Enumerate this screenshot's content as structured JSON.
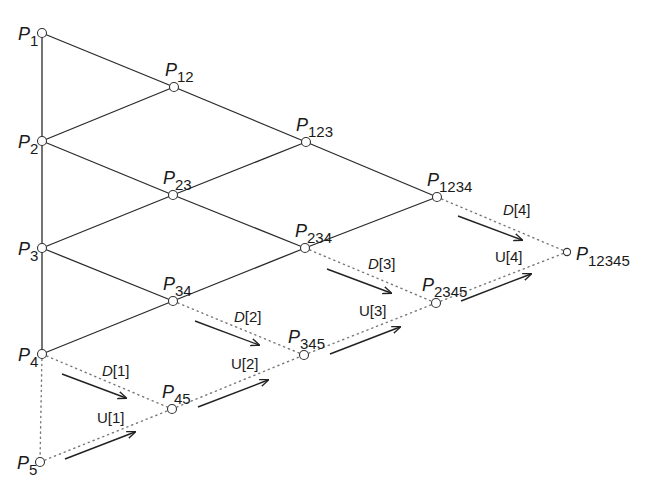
{
  "diagram": {
    "nodes": [
      {
        "id": "P1",
        "base": "P",
        "sub": "1",
        "x": 42,
        "y": 33,
        "lx": 18,
        "ly": 40
      },
      {
        "id": "P2",
        "base": "P",
        "sub": "2",
        "x": 42,
        "y": 141,
        "lx": 18,
        "ly": 148
      },
      {
        "id": "P3",
        "base": "P",
        "sub": "3",
        "x": 42,
        "y": 248,
        "lx": 18,
        "ly": 255
      },
      {
        "id": "P4",
        "base": "P",
        "sub": "4",
        "x": 42,
        "y": 354,
        "lx": 18,
        "ly": 361
      },
      {
        "id": "P5",
        "base": "P",
        "sub": "5",
        "x": 40,
        "y": 462,
        "lx": 17,
        "ly": 469
      },
      {
        "id": "P12",
        "base": "P",
        "sub": "12",
        "x": 174,
        "y": 87,
        "lx": 165,
        "ly": 76
      },
      {
        "id": "P23",
        "base": "P",
        "sub": "23",
        "x": 173,
        "y": 195,
        "lx": 163,
        "ly": 184
      },
      {
        "id": "P34",
        "base": "P",
        "sub": "34",
        "x": 173,
        "y": 301,
        "lx": 163,
        "ly": 290
      },
      {
        "id": "P45",
        "base": "P",
        "sub": "45",
        "x": 172,
        "y": 409,
        "lx": 162,
        "ly": 398
      },
      {
        "id": "P123",
        "base": "P",
        "sub": "123",
        "x": 306,
        "y": 142,
        "lx": 296,
        "ly": 131
      },
      {
        "id": "P234",
        "base": "P",
        "sub": "234",
        "x": 305,
        "y": 248,
        "lx": 295,
        "ly": 237
      },
      {
        "id": "P345",
        "base": "P",
        "sub": "345",
        "x": 304,
        "y": 355,
        "lx": 288,
        "ly": 343
      },
      {
        "id": "P1234",
        "base": "P",
        "sub": "1234",
        "x": 437,
        "y": 197,
        "lx": 427,
        "ly": 186
      },
      {
        "id": "P2345",
        "base": "P",
        "sub": "2345",
        "x": 436,
        "y": 303,
        "lx": 422,
        "ly": 291
      },
      {
        "id": "P12345",
        "base": "P",
        "sub": "12345",
        "x": 567,
        "y": 252,
        "lx": 576,
        "ly": 260
      }
    ],
    "solid_edges": [
      [
        "P1",
        "P2"
      ],
      [
        "P2",
        "P3"
      ],
      [
        "P3",
        "P4"
      ],
      [
        "P1",
        "P12"
      ],
      [
        "P2",
        "P12"
      ],
      [
        "P2",
        "P23"
      ],
      [
        "P3",
        "P23"
      ],
      [
        "P3",
        "P34"
      ],
      [
        "P4",
        "P34"
      ],
      [
        "P12",
        "P123"
      ],
      [
        "P23",
        "P123"
      ],
      [
        "P23",
        "P234"
      ],
      [
        "P34",
        "P234"
      ],
      [
        "P123",
        "P1234"
      ],
      [
        "P234",
        "P1234"
      ]
    ],
    "dotted_edges": [
      [
        "P4",
        "P5"
      ],
      [
        "P4",
        "P45"
      ],
      [
        "P5",
        "P45"
      ],
      [
        "P34",
        "P345"
      ],
      [
        "P45",
        "P345"
      ],
      [
        "P234",
        "P2345"
      ],
      [
        "P345",
        "P2345"
      ],
      [
        "P1234",
        "P12345"
      ],
      [
        "P2345",
        "P12345"
      ]
    ],
    "arrows": [
      {
        "id": "D1",
        "x1": 62,
        "y1": 374,
        "x2": 126,
        "y2": 398
      },
      {
        "id": "U1",
        "x1": 65,
        "y1": 459,
        "x2": 135,
        "y2": 432
      },
      {
        "id": "D2",
        "x1": 195,
        "y1": 321,
        "x2": 259,
        "y2": 345
      },
      {
        "id": "U2",
        "x1": 198,
        "y1": 407,
        "x2": 268,
        "y2": 380
      },
      {
        "id": "D3",
        "x1": 327,
        "y1": 269,
        "x2": 391,
        "y2": 293
      },
      {
        "id": "U3",
        "x1": 330,
        "y1": 354,
        "x2": 400,
        "y2": 327
      },
      {
        "id": "D4",
        "x1": 458,
        "y1": 216,
        "x2": 522,
        "y2": 240
      },
      {
        "id": "U4",
        "x1": 461,
        "y1": 301,
        "x2": 531,
        "y2": 274
      }
    ],
    "arrow_labels": [
      {
        "id": "D1",
        "name": "D",
        "index": "[1]",
        "italic": true,
        "x": 102,
        "y": 376
      },
      {
        "id": "U1",
        "name": "U",
        "index": "[1]",
        "italic": false,
        "x": 97,
        "y": 423
      },
      {
        "id": "D2",
        "name": "D",
        "index": "[2]",
        "italic": true,
        "x": 234,
        "y": 322
      },
      {
        "id": "U2",
        "name": "U",
        "index": "[2]",
        "italic": false,
        "x": 231,
        "y": 369
      },
      {
        "id": "D3",
        "name": "D",
        "index": "[3]",
        "italic": true,
        "x": 368,
        "y": 269
      },
      {
        "id": "U3",
        "name": "U",
        "index": "[3]",
        "italic": false,
        "x": 359,
        "y": 316
      },
      {
        "id": "D4",
        "name": "D",
        "index": "[4]",
        "italic": true,
        "x": 503,
        "y": 215
      },
      {
        "id": "U4",
        "name": "U",
        "index": "[4]",
        "italic": false,
        "x": 495,
        "y": 262
      }
    ],
    "colors": {
      "line": "#2a2a2a",
      "dotted": "#777777",
      "background": "#ffffff"
    }
  }
}
